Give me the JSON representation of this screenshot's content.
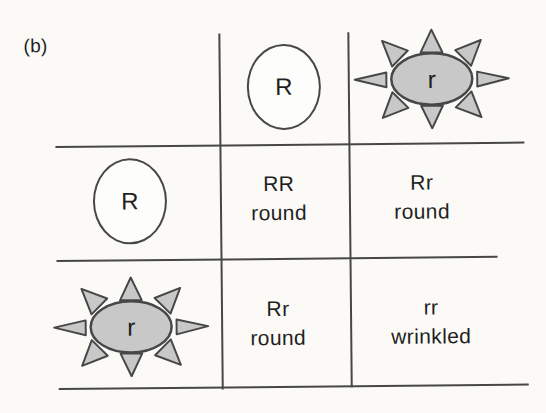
{
  "figure": {
    "label": "(b)"
  },
  "colors": {
    "background": "#fbfaf7",
    "line": "#474747",
    "text": "#1f1f1f",
    "seed_gray": "#c8c8c8"
  },
  "punnett": {
    "top_gametes": [
      {
        "allele": "R",
        "shape": "round-seed"
      },
      {
        "allele": "r",
        "shape": "wrinkled-seed"
      }
    ],
    "left_gametes": [
      {
        "allele": "R",
        "shape": "round-seed"
      },
      {
        "allele": "r",
        "shape": "wrinkled-seed"
      }
    ],
    "offspring": [
      {
        "genotype": "RR",
        "phenotype": "round"
      },
      {
        "genotype": "Rr",
        "phenotype": "round"
      },
      {
        "genotype": "Rr",
        "phenotype": "round"
      },
      {
        "genotype": "rr",
        "phenotype": "wrinkled"
      }
    ]
  }
}
